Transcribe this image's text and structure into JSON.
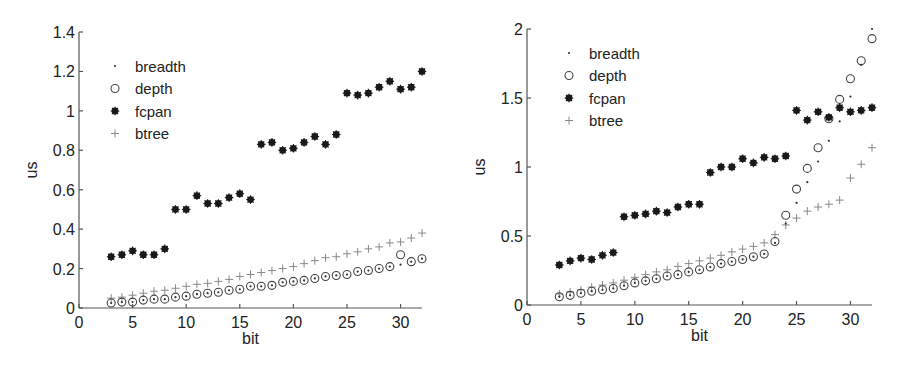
{
  "chart_data": [
    {
      "type": "scatter",
      "title": "",
      "xlabel": "bit",
      "ylabel": "us",
      "xlim": [
        0,
        32
      ],
      "ylim": [
        0,
        1.4
      ],
      "xticks": [
        0,
        5,
        10,
        15,
        20,
        25,
        30
      ],
      "yticks": [
        0,
        0.2,
        0.4,
        0.6,
        0.8,
        1,
        1.2,
        1.4
      ],
      "ytick_labels": [
        "0",
        "0.2",
        "0.4",
        "0.6",
        "0.8",
        "1",
        "1.2",
        "1.4"
      ],
      "grid": false,
      "legend_position": "upper left",
      "x": [
        3,
        4,
        5,
        6,
        7,
        8,
        9,
        10,
        11,
        12,
        13,
        14,
        15,
        16,
        17,
        18,
        19,
        20,
        21,
        22,
        23,
        24,
        25,
        26,
        27,
        28,
        29,
        30,
        31,
        32
      ],
      "series": [
        {
          "name": "breadth",
          "marker": "dot",
          "values": [
            0.025,
            0.03,
            0.03,
            0.04,
            0.045,
            0.045,
            0.055,
            0.06,
            0.07,
            0.075,
            0.08,
            0.09,
            0.095,
            0.11,
            0.11,
            0.115,
            0.13,
            0.135,
            0.14,
            0.15,
            0.16,
            0.165,
            0.17,
            0.185,
            0.19,
            0.2,
            0.21,
            0.22,
            0.235,
            0.25
          ]
        },
        {
          "name": "depth",
          "marker": "circle",
          "values": [
            0.025,
            0.03,
            0.03,
            0.04,
            0.045,
            0.045,
            0.055,
            0.06,
            0.07,
            0.075,
            0.08,
            0.09,
            0.095,
            0.11,
            0.11,
            0.115,
            0.13,
            0.135,
            0.14,
            0.15,
            0.16,
            0.165,
            0.17,
            0.185,
            0.19,
            0.2,
            0.21,
            0.27,
            0.235,
            0.25
          ]
        },
        {
          "name": "fcpan",
          "marker": "star",
          "values": [
            0.26,
            0.27,
            0.29,
            0.27,
            0.27,
            0.3,
            0.5,
            0.5,
            0.57,
            0.53,
            0.53,
            0.56,
            0.58,
            0.55,
            0.83,
            0.84,
            0.8,
            0.81,
            0.84,
            0.87,
            0.83,
            0.88,
            1.09,
            1.08,
            1.09,
            1.12,
            1.15,
            1.11,
            1.12,
            1.2
          ]
        },
        {
          "name": "btree",
          "marker": "plus",
          "values": [
            0.05,
            0.055,
            0.065,
            0.075,
            0.085,
            0.09,
            0.1,
            0.11,
            0.12,
            0.125,
            0.135,
            0.145,
            0.16,
            0.17,
            0.18,
            0.19,
            0.2,
            0.21,
            0.225,
            0.24,
            0.255,
            0.26,
            0.275,
            0.285,
            0.3,
            0.31,
            0.33,
            0.335,
            0.355,
            0.38
          ]
        }
      ]
    },
    {
      "type": "scatter",
      "title": "",
      "xlabel": "bit",
      "ylabel": "us",
      "xlim": [
        0,
        32
      ],
      "ylim": [
        0,
        2
      ],
      "xticks": [
        0,
        5,
        10,
        15,
        20,
        25,
        30
      ],
      "yticks": [
        0,
        0.5,
        1,
        1.5,
        2
      ],
      "ytick_labels": [
        "0",
        "0.5",
        "1",
        "1.5",
        "2"
      ],
      "grid": false,
      "legend_position": "upper left",
      "x": [
        3,
        4,
        5,
        6,
        7,
        8,
        9,
        10,
        11,
        12,
        13,
        14,
        15,
        16,
        17,
        18,
        19,
        20,
        21,
        22,
        23,
        24,
        25,
        26,
        27,
        28,
        29,
        30,
        31,
        32
      ],
      "series": [
        {
          "name": "breadth",
          "marker": "dot",
          "values": [
            0.06,
            0.07,
            0.085,
            0.1,
            0.11,
            0.12,
            0.14,
            0.16,
            0.175,
            0.19,
            0.21,
            0.22,
            0.24,
            0.255,
            0.275,
            0.3,
            0.315,
            0.33,
            0.35,
            0.37,
            0.45,
            0.59,
            0.74,
            0.89,
            1.04,
            1.19,
            1.33,
            1.51,
            1.74,
            2.0
          ]
        },
        {
          "name": "depth",
          "marker": "circle",
          "values": [
            0.06,
            0.07,
            0.085,
            0.1,
            0.11,
            0.12,
            0.14,
            0.16,
            0.175,
            0.19,
            0.21,
            0.22,
            0.24,
            0.255,
            0.275,
            0.3,
            0.315,
            0.33,
            0.35,
            0.37,
            0.46,
            0.65,
            0.84,
            0.99,
            1.14,
            1.35,
            1.49,
            1.64,
            1.77,
            1.93
          ]
        },
        {
          "name": "fcpan",
          "marker": "star",
          "values": [
            0.29,
            0.32,
            0.34,
            0.33,
            0.36,
            0.38,
            0.64,
            0.65,
            0.66,
            0.68,
            0.67,
            0.71,
            0.73,
            0.73,
            0.96,
            1.0,
            1.0,
            1.06,
            1.03,
            1.07,
            1.06,
            1.08,
            1.41,
            1.34,
            1.4,
            1.36,
            1.43,
            1.4,
            1.41,
            1.43
          ]
        },
        {
          "name": "btree",
          "marker": "plus",
          "values": [
            0.08,
            0.095,
            0.11,
            0.13,
            0.145,
            0.16,
            0.18,
            0.2,
            0.22,
            0.24,
            0.255,
            0.28,
            0.3,
            0.32,
            0.34,
            0.36,
            0.385,
            0.405,
            0.425,
            0.45,
            0.51,
            0.58,
            0.63,
            0.68,
            0.71,
            0.73,
            0.76,
            0.92,
            1.02,
            1.14
          ]
        }
      ]
    }
  ],
  "style": {
    "breadth_color": "#333333",
    "depth_color": "#444444",
    "fcpan_color": "#1a1a1a",
    "btree_color": "#888888",
    "axis_color": "#555555"
  }
}
